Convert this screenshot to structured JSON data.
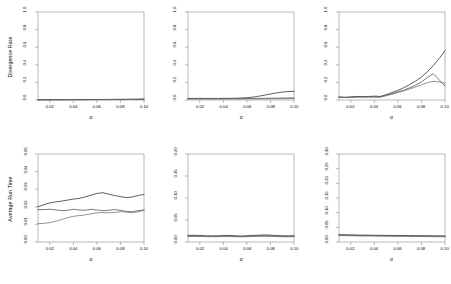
{
  "figure": {
    "layout": "2 rows x 3 columns of line plots",
    "rows": 2,
    "cols": 3
  },
  "chart_data": [
    {
      "id": "panel-top-left",
      "type": "line",
      "title": "",
      "xlabel": "σ",
      "ylabel": "Divergence Rate",
      "xlim": [
        0.01,
        0.1
      ],
      "ylim": [
        0.0,
        1.0
      ],
      "xticks": [
        0.02,
        0.04,
        0.06,
        0.08,
        0.1
      ],
      "xticklabels": [
        "0.02",
        "0.04",
        "0.06",
        "0.08",
        "0.10"
      ],
      "yticks": [
        0.0,
        0.2,
        0.4,
        0.6,
        0.8,
        1.0
      ],
      "yticklabels": [
        "0.0",
        "0.2",
        "0.4",
        "0.6",
        "0.8",
        "1.0"
      ],
      "grid": false,
      "legend": "none",
      "x": [
        0.01,
        0.015,
        0.02,
        0.025,
        0.03,
        0.035,
        0.04,
        0.045,
        0.05,
        0.055,
        0.06,
        0.065,
        0.07,
        0.075,
        0.08,
        0.085,
        0.09,
        0.095,
        0.1
      ],
      "series": [
        {
          "name": "method-1",
          "color": "#2b2b2b",
          "values": [
            0.004,
            0.004,
            0.004,
            0.005,
            0.004,
            0.004,
            0.005,
            0.005,
            0.005,
            0.006,
            0.006,
            0.006,
            0.007,
            0.007,
            0.008,
            0.008,
            0.009,
            0.01,
            0.011
          ]
        },
        {
          "name": "method-2",
          "color": "#4d4d4d",
          "values": [
            0.003,
            0.003,
            0.003,
            0.003,
            0.004,
            0.004,
            0.004,
            0.004,
            0.004,
            0.005,
            0.005,
            0.005,
            0.005,
            0.006,
            0.006,
            0.006,
            0.007,
            0.007,
            0.008
          ]
        },
        {
          "name": "method-3",
          "color": "#6e6e6e",
          "values": [
            0.002,
            0.002,
            0.002,
            0.002,
            0.002,
            0.003,
            0.003,
            0.003,
            0.003,
            0.003,
            0.004,
            0.004,
            0.004,
            0.004,
            0.004,
            0.005,
            0.005,
            0.005,
            0.006
          ]
        }
      ]
    },
    {
      "id": "panel-top-middle",
      "type": "line",
      "title": "",
      "xlabel": "σ",
      "ylabel": "",
      "xlim": [
        0.01,
        0.1
      ],
      "ylim": [
        0.0,
        1.0
      ],
      "xticks": [
        0.02,
        0.04,
        0.06,
        0.08,
        0.1
      ],
      "xticklabels": [
        "0.02",
        "0.04",
        "0.06",
        "0.08",
        "0.10"
      ],
      "yticks": [
        0.0,
        0.2,
        0.4,
        0.6,
        0.8,
        1.0
      ],
      "yticklabels": [
        "0.0",
        "0.2",
        "0.4",
        "0.6",
        "0.8",
        "1.0"
      ],
      "grid": false,
      "legend": "none",
      "x": [
        0.01,
        0.015,
        0.02,
        0.025,
        0.03,
        0.035,
        0.04,
        0.045,
        0.05,
        0.055,
        0.06,
        0.065,
        0.07,
        0.075,
        0.08,
        0.085,
        0.09,
        0.095,
        0.1
      ],
      "series": [
        {
          "name": "method-1",
          "color": "#2b2b2b",
          "values": [
            0.018,
            0.018,
            0.018,
            0.018,
            0.018,
            0.018,
            0.019,
            0.019,
            0.02,
            0.022,
            0.026,
            0.033,
            0.043,
            0.055,
            0.068,
            0.08,
            0.09,
            0.096,
            0.099
          ]
        },
        {
          "name": "method-2",
          "color": "#4d4d4d",
          "values": [
            0.015,
            0.015,
            0.015,
            0.015,
            0.015,
            0.015,
            0.015,
            0.015,
            0.015,
            0.016,
            0.016,
            0.017,
            0.018,
            0.019,
            0.02,
            0.021,
            0.022,
            0.023,
            0.024
          ]
        },
        {
          "name": "method-3",
          "color": "#6e6e6e",
          "values": [
            0.012,
            0.012,
            0.012,
            0.012,
            0.012,
            0.012,
            0.012,
            0.012,
            0.012,
            0.012,
            0.013,
            0.013,
            0.013,
            0.014,
            0.014,
            0.015,
            0.015,
            0.016,
            0.016
          ]
        }
      ]
    },
    {
      "id": "panel-top-right",
      "type": "line",
      "title": "",
      "xlabel": "σ",
      "ylabel": "",
      "xlim": [
        0.01,
        0.1
      ],
      "ylim": [
        0.0,
        1.0
      ],
      "xticks": [
        0.02,
        0.04,
        0.06,
        0.08,
        0.1
      ],
      "xticklabels": [
        "0.02",
        "0.04",
        "0.06",
        "0.08",
        "0.10"
      ],
      "yticks": [
        0.0,
        0.2,
        0.4,
        0.6,
        0.8,
        1.0
      ],
      "yticklabels": [
        "0.0",
        "0.2",
        "0.4",
        "0.6",
        "0.8",
        "1.0"
      ],
      "grid": false,
      "legend": "none",
      "x": [
        0.01,
        0.015,
        0.02,
        0.025,
        0.03,
        0.035,
        0.04,
        0.045,
        0.05,
        0.055,
        0.06,
        0.065,
        0.07,
        0.075,
        0.08,
        0.085,
        0.09,
        0.095,
        0.1
      ],
      "series": [
        {
          "name": "method-1",
          "color": "#2b2b2b",
          "values": [
            0.035,
            0.03,
            0.034,
            0.041,
            0.038,
            0.04,
            0.044,
            0.04,
            0.06,
            0.085,
            0.11,
            0.14,
            0.175,
            0.215,
            0.26,
            0.32,
            0.39,
            0.47,
            0.56
          ]
        },
        {
          "name": "method-2",
          "color": "#4d4d4d",
          "values": [
            0.032,
            0.03,
            0.032,
            0.036,
            0.036,
            0.036,
            0.036,
            0.035,
            0.052,
            0.072,
            0.092,
            0.112,
            0.138,
            0.168,
            0.205,
            0.255,
            0.3,
            0.23,
            0.16
          ]
        },
        {
          "name": "method-3",
          "color": "#6e6e6e",
          "values": [
            0.03,
            0.028,
            0.03,
            0.033,
            0.033,
            0.033,
            0.033,
            0.032,
            0.048,
            0.066,
            0.085,
            0.104,
            0.125,
            0.148,
            0.172,
            0.196,
            0.212,
            0.206,
            0.19
          ]
        }
      ]
    },
    {
      "id": "panel-bottom-left",
      "type": "line",
      "title": "",
      "xlabel": "σ",
      "ylabel": "Average Run Time",
      "xlim": [
        0.01,
        0.1
      ],
      "ylim": [
        0.0,
        0.05
      ],
      "xticks": [
        0.02,
        0.04,
        0.06,
        0.08,
        0.1
      ],
      "xticklabels": [
        "0.02",
        "0.04",
        "0.06",
        "0.08",
        "0.10"
      ],
      "yticks": [
        0.0,
        0.01,
        0.02,
        0.03,
        0.04,
        0.05
      ],
      "yticklabels": [
        "0.00",
        "0.01",
        "0.02",
        "0.03",
        "0.04",
        "0.05"
      ],
      "grid": false,
      "legend": "none",
      "x": [
        0.01,
        0.015,
        0.02,
        0.025,
        0.03,
        0.035,
        0.04,
        0.045,
        0.05,
        0.055,
        0.06,
        0.065,
        0.07,
        0.075,
        0.08,
        0.085,
        0.09,
        0.095,
        0.1
      ],
      "series": [
        {
          "name": "method-1",
          "color": "#2b2b2b",
          "values": [
            0.02,
            0.0212,
            0.0222,
            0.0228,
            0.0232,
            0.0238,
            0.0244,
            0.0248,
            0.0256,
            0.0266,
            0.0276,
            0.028,
            0.0272,
            0.0264,
            0.0258,
            0.0252,
            0.0256,
            0.0264,
            0.027
          ]
        },
        {
          "name": "method-2",
          "color": "#4d4d4d",
          "values": [
            0.0184,
            0.0184,
            0.0186,
            0.0182,
            0.0178,
            0.018,
            0.0186,
            0.0182,
            0.018,
            0.0186,
            0.0182,
            0.0178,
            0.018,
            0.0184,
            0.018,
            0.0174,
            0.0172,
            0.0178,
            0.0182
          ]
        },
        {
          "name": "method-3",
          "color": "#6e6e6e",
          "values": [
            0.0104,
            0.0106,
            0.011,
            0.0118,
            0.0128,
            0.0138,
            0.0146,
            0.015,
            0.0154,
            0.016,
            0.0166,
            0.0168,
            0.0166,
            0.0168,
            0.0172,
            0.017,
            0.0166,
            0.0172,
            0.018
          ]
        }
      ]
    },
    {
      "id": "panel-bottom-middle",
      "type": "line",
      "title": "",
      "xlabel": "σ",
      "ylabel": "",
      "xlim": [
        0.01,
        0.1
      ],
      "ylim": [
        0.0,
        0.2
      ],
      "xticks": [
        0.02,
        0.04,
        0.06,
        0.08,
        0.1
      ],
      "xticklabels": [
        "0.02",
        "0.04",
        "0.06",
        "0.08",
        "0.10"
      ],
      "yticks": [
        0.0,
        0.05,
        0.1,
        0.15,
        0.2
      ],
      "yticklabels": [
        "0.00",
        "0.05",
        "0.10",
        "0.15",
        "0.20"
      ],
      "grid": false,
      "legend": "none",
      "x": [
        0.01,
        0.015,
        0.02,
        0.025,
        0.03,
        0.035,
        0.04,
        0.045,
        0.05,
        0.055,
        0.06,
        0.065,
        0.07,
        0.075,
        0.08,
        0.085,
        0.09,
        0.095,
        0.1
      ],
      "series": [
        {
          "name": "method-1",
          "color": "#2b2b2b",
          "values": [
            0.015,
            0.0152,
            0.0148,
            0.0142,
            0.0138,
            0.014,
            0.0146,
            0.015,
            0.0142,
            0.0136,
            0.0142,
            0.015,
            0.0156,
            0.016,
            0.0156,
            0.0148,
            0.0142,
            0.014,
            0.0142
          ]
        },
        {
          "name": "method-2",
          "color": "#4d4d4d",
          "values": [
            0.0138,
            0.0138,
            0.0136,
            0.0132,
            0.0128,
            0.013,
            0.0134,
            0.0136,
            0.013,
            0.0126,
            0.013,
            0.0136,
            0.014,
            0.0142,
            0.014,
            0.0134,
            0.013,
            0.0128,
            0.013
          ]
        },
        {
          "name": "method-3",
          "color": "#6e6e6e",
          "values": [
            0.0126,
            0.0126,
            0.0124,
            0.0122,
            0.012,
            0.012,
            0.0122,
            0.0124,
            0.012,
            0.0118,
            0.012,
            0.0124,
            0.0126,
            0.0128,
            0.0126,
            0.0122,
            0.012,
            0.0118,
            0.012
          ]
        }
      ]
    },
    {
      "id": "panel-bottom-right",
      "type": "line",
      "title": "",
      "xlabel": "σ",
      "ylabel": "",
      "xlim": [
        0.01,
        0.1
      ],
      "ylim": [
        0.0,
        0.3
      ],
      "xticks": [
        0.02,
        0.04,
        0.06,
        0.08,
        0.1
      ],
      "xticklabels": [
        "0.02",
        "0.04",
        "0.06",
        "0.08",
        "0.10"
      ],
      "yticks": [
        0.0,
        0.05,
        0.1,
        0.15,
        0.2,
        0.25,
        0.3
      ],
      "yticklabels": [
        "0.00",
        "0.05",
        "0.10",
        "0.15",
        "0.20",
        "0.25",
        "0.30"
      ],
      "grid": false,
      "legend": "none",
      "x": [
        0.01,
        0.015,
        0.02,
        0.025,
        0.03,
        0.035,
        0.04,
        0.045,
        0.05,
        0.055,
        0.06,
        0.065,
        0.07,
        0.075,
        0.08,
        0.085,
        0.09,
        0.095,
        0.1
      ],
      "series": [
        {
          "name": "method-1",
          "color": "#2b2b2b",
          "values": [
            0.025,
            0.0246,
            0.0242,
            0.0238,
            0.0236,
            0.0234,
            0.023,
            0.0228,
            0.0226,
            0.0224,
            0.0222,
            0.022,
            0.0218,
            0.0216,
            0.0214,
            0.0212,
            0.021,
            0.0208,
            0.0206
          ]
        },
        {
          "name": "method-2",
          "color": "#4d4d4d",
          "values": [
            0.0232,
            0.023,
            0.0226,
            0.0222,
            0.022,
            0.0218,
            0.0216,
            0.0214,
            0.0212,
            0.021,
            0.0208,
            0.0206,
            0.0204,
            0.0202,
            0.02,
            0.0198,
            0.0196,
            0.0194,
            0.0192
          ]
        },
        {
          "name": "method-3",
          "color": "#6e6e6e",
          "values": [
            0.0216,
            0.0214,
            0.0212,
            0.0208,
            0.0206,
            0.0204,
            0.0202,
            0.02,
            0.0198,
            0.0196,
            0.0194,
            0.0192,
            0.019,
            0.0188,
            0.0186,
            0.0184,
            0.0182,
            0.018,
            0.0178
          ]
        }
      ]
    }
  ]
}
